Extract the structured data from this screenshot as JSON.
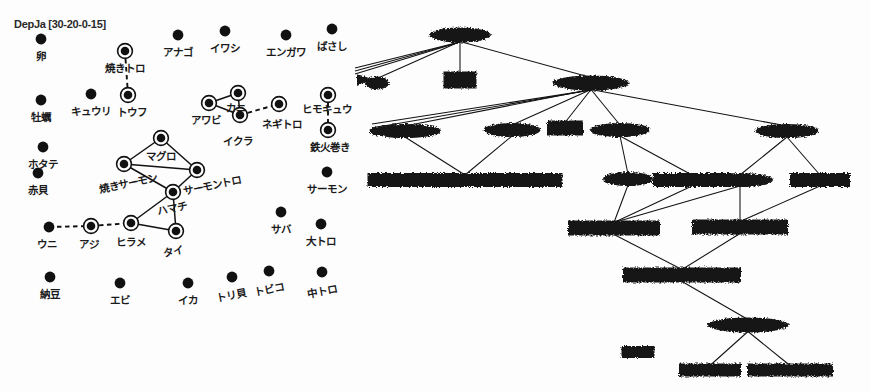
{
  "graph": {
    "title": "DepJa [30-20-0-15]",
    "nodes": [
      {
        "id": "tamago",
        "label": "卵",
        "x": 41,
        "y": 39,
        "ring": false,
        "lx": 41,
        "ly": 48
      },
      {
        "id": "yakitoro",
        "label": "焼きトロ",
        "x": 125,
        "y": 51,
        "ring": true,
        "lx": 125,
        "ly": 60
      },
      {
        "id": "anago",
        "label": "アナゴ",
        "x": 178,
        "y": 35,
        "ring": false,
        "lx": 178,
        "ly": 44
      },
      {
        "id": "iwashi",
        "label": "イワシ",
        "x": 225,
        "y": 31,
        "ring": false,
        "lx": 225,
        "ly": 40
      },
      {
        "id": "engawa",
        "label": "エンガワ",
        "x": 286,
        "y": 35,
        "ring": false,
        "lx": 286,
        "ly": 44
      },
      {
        "id": "basashi",
        "label": "ばさし",
        "x": 332,
        "y": 29,
        "ring": false,
        "lx": 332,
        "ly": 38
      },
      {
        "id": "kaki",
        "label": "牡蠣",
        "x": 41,
        "y": 100,
        "ring": false,
        "lx": 41,
        "ly": 109
      },
      {
        "id": "kyuuri",
        "label": "キュウリ",
        "x": 91,
        "y": 94,
        "ring": false,
        "lx": 91,
        "ly": 103
      },
      {
        "id": "toufu",
        "label": "トウフ",
        "x": 128,
        "y": 95,
        "ring": true,
        "lx": 132,
        "ly": 104
      },
      {
        "id": "awabi",
        "label": "アワビ",
        "x": 209,
        "y": 103,
        "ring": true,
        "lx": 206,
        "ly": 112
      },
      {
        "id": "kani",
        "label": "カニ",
        "x": 238,
        "y": 93,
        "ring": true,
        "lx": 236,
        "ly": 100
      },
      {
        "id": "ikura",
        "label": "イクラ",
        "x": 240,
        "y": 115,
        "ring": true,
        "lx": 238,
        "ly": 133
      },
      {
        "id": "negitoro",
        "label": "ネギトロ",
        "x": 279,
        "y": 104,
        "ring": true,
        "lx": 282,
        "ly": 116
      },
      {
        "id": "himokyuu",
        "label": "ヒモキュウ",
        "x": 328,
        "y": 95,
        "ring": true,
        "lx": 327,
        "ly": 101
      },
      {
        "id": "tekkamaki",
        "label": "鉄火巻き",
        "x": 328,
        "y": 130,
        "ring": true,
        "lx": 330,
        "ly": 139
      },
      {
        "id": "hotate",
        "label": "ホタテ",
        "x": 43,
        "y": 147,
        "ring": false,
        "lx": 43,
        "ly": 156
      },
      {
        "id": "maguro",
        "label": "マグロ",
        "x": 161,
        "y": 138,
        "ring": true,
        "lx": 161,
        "ly": 148
      },
      {
        "id": "akagai",
        "label": "赤貝",
        "x": 38,
        "y": 173,
        "ring": false,
        "lx": 38,
        "ly": 182
      },
      {
        "id": "yakisalmon",
        "label": "焼きサーモン",
        "x": 124,
        "y": 164,
        "ring": true,
        "lx": 128,
        "ly": 175
      },
      {
        "id": "salmontoro",
        "label": "サーモントロ",
        "x": 197,
        "y": 170,
        "ring": true,
        "lx": 212,
        "ly": 177
      },
      {
        "id": "salmon",
        "label": "サーモン",
        "x": 327,
        "y": 172,
        "ring": false,
        "lx": 327,
        "ly": 181
      },
      {
        "id": "hamachi",
        "label": "ハマチ",
        "x": 173,
        "y": 192,
        "ring": true,
        "lx": 172,
        "ly": 200
      },
      {
        "id": "uni",
        "label": "ウニ",
        "x": 49,
        "y": 227,
        "ring": false,
        "lx": 47,
        "ly": 236
      },
      {
        "id": "aji",
        "label": "アジ",
        "x": 91,
        "y": 226,
        "ring": true,
        "lx": 89,
        "ly": 236
      },
      {
        "id": "hirame",
        "label": "ヒラメ",
        "x": 131,
        "y": 223,
        "ring": true,
        "lx": 131,
        "ly": 234
      },
      {
        "id": "tai",
        "label": "タイ",
        "x": 176,
        "y": 231,
        "ring": true,
        "lx": 173,
        "ly": 243
      },
      {
        "id": "saba",
        "label": "サバ",
        "x": 281,
        "y": 212,
        "ring": false,
        "lx": 281,
        "ly": 221
      },
      {
        "id": "ootoro",
        "label": "大トロ",
        "x": 321,
        "y": 224,
        "ring": false,
        "lx": 321,
        "ly": 233
      },
      {
        "id": "nattou",
        "label": "納豆",
        "x": 50,
        "y": 277,
        "ring": false,
        "lx": 50,
        "ly": 286
      },
      {
        "id": "ebi",
        "label": "エビ",
        "x": 120,
        "y": 283,
        "ring": false,
        "lx": 120,
        "ly": 292
      },
      {
        "id": "ika",
        "label": "イカ",
        "x": 188,
        "y": 283,
        "ring": false,
        "lx": 188,
        "ly": 292
      },
      {
        "id": "torigai",
        "label": "トリ貝",
        "x": 232,
        "y": 277,
        "ring": false,
        "lx": 231,
        "ly": 287
      },
      {
        "id": "tobiko",
        "label": "トビコ",
        "x": 269,
        "y": 271,
        "ring": false,
        "lx": 269,
        "ly": 281
      },
      {
        "id": "chuutoro",
        "label": "中トロ",
        "x": 322,
        "y": 272,
        "ring": false,
        "lx": 322,
        "ly": 283
      }
    ],
    "edges": [
      {
        "from": "yakitoro",
        "to": "toufu",
        "style": "dashed"
      },
      {
        "from": "awabi",
        "to": "kani",
        "style": "solid"
      },
      {
        "from": "awabi",
        "to": "ikura",
        "style": "solid"
      },
      {
        "from": "kani",
        "to": "ikura",
        "style": "solid"
      },
      {
        "from": "ikura",
        "to": "negitoro",
        "style": "dashed"
      },
      {
        "from": "himokyuu",
        "to": "tekkamaki",
        "style": "dashed"
      },
      {
        "from": "maguro",
        "to": "yakisalmon",
        "style": "solid"
      },
      {
        "from": "maguro",
        "to": "salmontoro",
        "style": "solid"
      },
      {
        "from": "yakisalmon",
        "to": "salmontoro",
        "style": "solid"
      },
      {
        "from": "yakisalmon",
        "to": "hamachi",
        "style": "solid"
      },
      {
        "from": "salmontoro",
        "to": "hamachi",
        "style": "solid"
      },
      {
        "from": "hamachi",
        "to": "hirame",
        "style": "solid"
      },
      {
        "from": "hamachi",
        "to": "tai",
        "style": "solid"
      },
      {
        "from": "hirame",
        "to": "tai",
        "style": "solid"
      },
      {
        "from": "uni",
        "to": "aji",
        "style": "dashed"
      },
      {
        "from": "aji",
        "to": "hirame",
        "style": "dashed"
      }
    ],
    "rotated_labels": [
      "torigai",
      "tobiko",
      "chuutoro",
      "salmontoro",
      "yakisalmon",
      "hamachi",
      "tai"
    ]
  },
  "tree": {
    "nodes": [
      {
        "id": "t-root",
        "cx": 460,
        "cy": 35,
        "w": 62,
        "h": 15,
        "shape": "blob"
      },
      {
        "id": "t-b1",
        "cx": 460,
        "cy": 80,
        "w": 33,
        "h": 17,
        "shape": "box"
      },
      {
        "id": "t-b2",
        "cx": 591,
        "cy": 83,
        "w": 77,
        "h": 15,
        "shape": "blob"
      },
      {
        "id": "t-l0",
        "cx": 377,
        "cy": 83,
        "w": 24,
        "h": 13,
        "shape": "blob"
      },
      {
        "id": "t-c1",
        "cx": 405,
        "cy": 131,
        "w": 72,
        "h": 14,
        "shape": "blob"
      },
      {
        "id": "t-c2",
        "cx": 512,
        "cy": 130,
        "w": 57,
        "h": 14,
        "shape": "blob"
      },
      {
        "id": "t-c3",
        "cx": 565,
        "cy": 128,
        "w": 36,
        "h": 15,
        "shape": "box"
      },
      {
        "id": "t-c4",
        "cx": 620,
        "cy": 130,
        "w": 60,
        "h": 14,
        "shape": "blob"
      },
      {
        "id": "t-c5",
        "cx": 787,
        "cy": 131,
        "w": 64,
        "h": 14,
        "shape": "blob"
      },
      {
        "id": "t-d1",
        "cx": 465,
        "cy": 180,
        "w": 195,
        "h": 14,
        "shape": "bar"
      },
      {
        "id": "t-d2",
        "cx": 628,
        "cy": 179,
        "w": 50,
        "h": 14,
        "shape": "blob"
      },
      {
        "id": "t-d3",
        "cx": 692,
        "cy": 180,
        "w": 78,
        "h": 14,
        "shape": "bar"
      },
      {
        "id": "t-d4",
        "cx": 740,
        "cy": 180,
        "w": 66,
        "h": 14,
        "shape": "blob"
      },
      {
        "id": "t-d5",
        "cx": 820,
        "cy": 180,
        "w": 60,
        "h": 14,
        "shape": "bar"
      },
      {
        "id": "t-e1",
        "cx": 614,
        "cy": 228,
        "w": 92,
        "h": 15,
        "shape": "bar"
      },
      {
        "id": "t-e2",
        "cx": 740,
        "cy": 227,
        "w": 96,
        "h": 15,
        "shape": "bar"
      },
      {
        "id": "t-f1",
        "cx": 682,
        "cy": 275,
        "w": 118,
        "h": 15,
        "shape": "bar"
      },
      {
        "id": "t-g1",
        "cx": 748,
        "cy": 325,
        "w": 82,
        "h": 15,
        "shape": "blob"
      },
      {
        "id": "t-h1",
        "cx": 638,
        "cy": 352,
        "w": 33,
        "h": 12,
        "shape": "box"
      },
      {
        "id": "t-h2",
        "cx": 710,
        "cy": 370,
        "w": 62,
        "h": 13,
        "shape": "bar"
      },
      {
        "id": "t-h3",
        "cx": 790,
        "cy": 370,
        "w": 86,
        "h": 13,
        "shape": "bar"
      }
    ],
    "edges": [
      {
        "from": "t-root",
        "to": "t-b1"
      },
      {
        "from": "t-root",
        "to": "t-b2"
      },
      {
        "from": "t-root",
        "to": "t-l0"
      },
      {
        "from": "t-b2",
        "to": "t-c1"
      },
      {
        "from": "t-b2",
        "to": "t-c2"
      },
      {
        "from": "t-b2",
        "to": "t-c3"
      },
      {
        "from": "t-b2",
        "to": "t-c4"
      },
      {
        "from": "t-b2",
        "to": "t-c5"
      },
      {
        "from": "t-c1",
        "to": "t-d1"
      },
      {
        "from": "t-c2",
        "to": "t-d1"
      },
      {
        "from": "t-c4",
        "to": "t-d2"
      },
      {
        "from": "t-c4",
        "to": "t-d3"
      },
      {
        "from": "t-c5",
        "to": "t-d4"
      },
      {
        "from": "t-c5",
        "to": "t-d5"
      },
      {
        "from": "t-d2",
        "to": "t-e1"
      },
      {
        "from": "t-d3",
        "to": "t-e1"
      },
      {
        "from": "t-d4",
        "to": "t-e1"
      },
      {
        "from": "t-d4",
        "to": "t-e2"
      },
      {
        "from": "t-d5",
        "to": "t-e2"
      },
      {
        "from": "t-e1",
        "to": "t-f1"
      },
      {
        "from": "t-e2",
        "to": "t-f1"
      },
      {
        "from": "t-f1",
        "to": "t-g1"
      },
      {
        "from": "t-g1",
        "to": "t-h2"
      },
      {
        "from": "t-g1",
        "to": "t-h3"
      }
    ]
  }
}
